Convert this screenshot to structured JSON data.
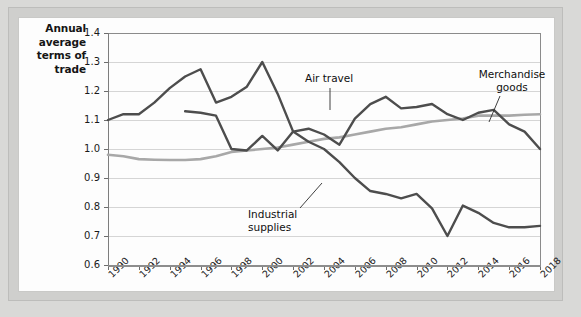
{
  "chart_data": {
    "type": "line",
    "title": "",
    "ylabel": "Annual average terms of trade",
    "xlabel": "",
    "ylim": [
      0.6,
      1.4
    ],
    "xlim": [
      1990,
      2018
    ],
    "y_ticks": [
      "0.6",
      "0.7",
      "0.8",
      "0.9",
      "1.0",
      "1.1",
      "1.2",
      "1.3",
      "1.4"
    ],
    "x_ticks": [
      "1990",
      "1992",
      "1994",
      "1996",
      "1998",
      "2000",
      "2002",
      "2004",
      "2006",
      "2008",
      "2010",
      "2012",
      "2014",
      "2016",
      "2018"
    ],
    "grid": true,
    "legend": "inline-annotations",
    "x": [
      1990,
      1991,
      1992,
      1993,
      1994,
      1995,
      1996,
      1997,
      1998,
      1999,
      2000,
      2001,
      2002,
      2003,
      2004,
      2005,
      2006,
      2007,
      2008,
      2009,
      2010,
      2011,
      2012,
      2013,
      2014,
      2015,
      2016,
      2017,
      2018
    ],
    "series": [
      {
        "name": "Industrial supplies",
        "color": "#4d4d4d",
        "values": [
          1.1,
          1.12,
          1.12,
          1.16,
          1.21,
          1.25,
          1.275,
          1.16,
          1.18,
          1.215,
          1.3,
          1.19,
          1.06,
          1.025,
          1.0,
          0.955,
          0.9,
          0.855,
          0.845,
          0.83,
          0.845,
          0.795,
          0.7,
          0.805,
          0.78,
          0.745,
          0.73,
          0.73,
          0.735
        ]
      },
      {
        "name": "Air travel",
        "color": "#4d4d4d",
        "values": [
          null,
          null,
          null,
          null,
          null,
          1.13,
          1.125,
          1.115,
          1.0,
          0.995,
          1.045,
          0.995,
          1.06,
          1.07,
          1.05,
          1.015,
          1.105,
          1.155,
          1.18,
          1.14,
          1.145,
          1.155,
          1.12,
          1.1,
          1.125,
          1.135,
          1.085,
          1.06,
          1.0
        ]
      },
      {
        "name": "Merchandise goods",
        "color": "#a8a8a8",
        "values": [
          0.98,
          0.975,
          0.965,
          0.963,
          0.962,
          0.962,
          0.965,
          0.975,
          0.99,
          0.995,
          1.0,
          1.005,
          1.015,
          1.025,
          1.035,
          1.04,
          1.05,
          1.06,
          1.07,
          1.075,
          1.085,
          1.095,
          1.1,
          1.105,
          1.115,
          1.115,
          1.115,
          1.118,
          1.12
        ]
      }
    ],
    "annotations": [
      {
        "name": "air-travel-label",
        "text": "Air travel"
      },
      {
        "name": "merchandise-goods-label",
        "text": "Merchandise\ngoods"
      },
      {
        "name": "industrial-supplies-label",
        "text": "Industrial\nsupplies"
      }
    ]
  },
  "axis_title": {
    "line1": "Annual",
    "line2": "average",
    "line3": "terms of",
    "line4": "trade"
  },
  "labels": {
    "air_travel": "Air travel",
    "merchandise_line1": "Merchandise",
    "merchandise_line2": "goods",
    "industrial_line1": "Industrial",
    "industrial_line2": "supplies"
  },
  "colors": {
    "dark_series": "#4d4d4d",
    "light_series": "#a8a8a8",
    "gridline": "#d5d5d5",
    "panel_bg": "#fdfdfd",
    "frame_bg": "#d9d9d7"
  }
}
